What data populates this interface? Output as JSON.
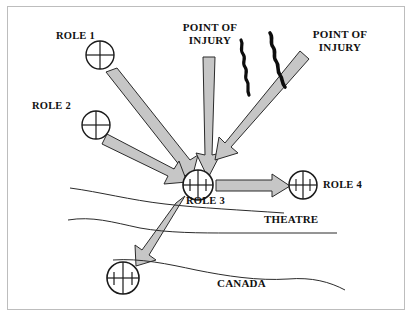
{
  "figure": {
    "type": "medical-evacuation-flow-diagram",
    "border_color": "#bdbdbd",
    "arrow_fill": "#c6c6c6",
    "arrow_stroke": "#2b2b2b",
    "squiggle_color": "#0d0d0d",
    "boundary_color": "#2b2b2b",
    "text_color": "#111111",
    "background": "#ffffff"
  },
  "labels": {
    "role1": "ROLE 1",
    "role2": "ROLE 2",
    "role3": "ROLE 3",
    "role4": "ROLE 4",
    "point_of_injury_center_line1": "POINT OF",
    "point_of_injury_center_line2": "INJURY",
    "point_of_injury_right_line1": "POINT OF",
    "point_of_injury_right_line2": "INJURY",
    "theatre": "THEATRE",
    "canada": "CANADA"
  },
  "nodes": [
    {
      "id": "role1",
      "label": "ROLE 1",
      "symbol": "cross-circle",
      "ticks": 0,
      "cx": 100,
      "cy": 55,
      "r": 14
    },
    {
      "id": "role2",
      "label": "ROLE 2",
      "symbol": "cross-circle",
      "ticks": 0,
      "cx": 96,
      "cy": 125,
      "r": 14
    },
    {
      "id": "role3",
      "label": "ROLE 3",
      "symbol": "ticked-circle",
      "ticks": 3,
      "cx": 198,
      "cy": 185,
      "r": 15
    },
    {
      "id": "role4",
      "label": "ROLE 4",
      "symbol": "ticked-circle",
      "ticks": 2,
      "cx": 303,
      "cy": 185,
      "r": 14
    },
    {
      "id": "role4-canada",
      "label": "",
      "symbol": "ticked-circle",
      "ticks": 2,
      "cx": 123,
      "cy": 278,
      "r": 16
    }
  ],
  "arrows": [
    {
      "id": "role1-to-role3",
      "from": "role1",
      "to": "role3"
    },
    {
      "id": "role2-to-role3",
      "from": "role2",
      "to": "role3"
    },
    {
      "id": "poi-center-to-role3",
      "from": "point-of-injury-center",
      "to": "role3"
    },
    {
      "id": "poi-right-to-role3",
      "from": "point-of-injury-right",
      "to": "role3"
    },
    {
      "id": "role3-to-role4",
      "from": "role3",
      "to": "role4"
    },
    {
      "id": "role3-to-canada",
      "from": "role3",
      "to": "role4-canada"
    }
  ],
  "regions": [
    {
      "id": "theatre",
      "label": "THEATRE"
    },
    {
      "id": "canada",
      "label": "CANADA"
    }
  ]
}
